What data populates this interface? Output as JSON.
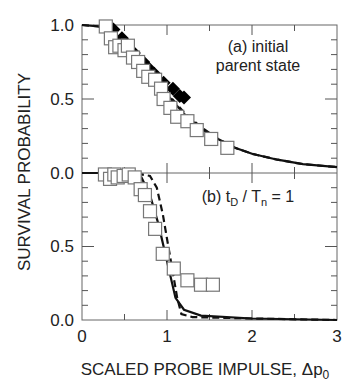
{
  "chart_data": [
    {
      "panel": "a",
      "type": "scatter",
      "annotation_line1": "(a) initial",
      "annotation_line2": "parent state",
      "xlabel": "SCALED  PROBE  IMPULSE, Δp0",
      "ylabel": "SURVIVAL  PROBABILITY",
      "xlim": [
        0,
        3
      ],
      "ylim": [
        0,
        1
      ],
      "yticks": [
        "0.0",
        "0.5",
        "1.0"
      ],
      "series": [
        {
          "name": "open squares (experiment)",
          "marker": "square-open",
          "points": [
            [
              0.28,
              0.99
            ],
            [
              0.34,
              0.91
            ],
            [
              0.39,
              0.85
            ],
            [
              0.44,
              0.86
            ],
            [
              0.5,
              0.83
            ],
            [
              0.54,
              0.86
            ],
            [
              0.6,
              0.78
            ],
            [
              0.66,
              0.75
            ],
            [
              0.72,
              0.69
            ],
            [
              0.78,
              0.65
            ],
            [
              0.86,
              0.63
            ],
            [
              0.93,
              0.57
            ],
            [
              0.96,
              0.5
            ],
            [
              1.04,
              0.44
            ],
            [
              1.12,
              0.38
            ],
            [
              1.24,
              0.35
            ],
            [
              1.35,
              0.29
            ],
            [
              1.52,
              0.23
            ],
            [
              1.71,
              0.17
            ]
          ]
        },
        {
          "name": "filled diamonds",
          "marker": "diamond-filled",
          "points": [
            [
              0.37,
              0.97
            ],
            [
              0.47,
              0.91
            ],
            [
              0.52,
              0.86
            ],
            [
              0.61,
              0.81
            ],
            [
              0.72,
              0.75
            ],
            [
              0.78,
              0.71
            ],
            [
              0.85,
              0.67
            ],
            [
              0.96,
              0.61
            ],
            [
              1.07,
              0.57
            ],
            [
              1.15,
              0.52
            ],
            [
              1.2,
              0.51
            ]
          ]
        },
        {
          "name": "solid line (theory)",
          "style": "solid",
          "points": [
            [
              0,
              1.0
            ],
            [
              0.2,
              0.99
            ],
            [
              0.4,
              0.93
            ],
            [
              0.6,
              0.82
            ],
            [
              0.8,
              0.68
            ],
            [
              1.0,
              0.53
            ],
            [
              1.2,
              0.4
            ],
            [
              1.4,
              0.3
            ],
            [
              1.6,
              0.23
            ],
            [
              1.8,
              0.17
            ],
            [
              2.0,
              0.13
            ],
            [
              2.3,
              0.09
            ],
            [
              2.6,
              0.06
            ],
            [
              3.0,
              0.04
            ]
          ]
        },
        {
          "name": "dashed line (theory)",
          "style": "dashed",
          "points": [
            [
              0,
              1.0
            ],
            [
              0.2,
              0.99
            ],
            [
              0.4,
              0.93
            ],
            [
              0.6,
              0.83
            ],
            [
              0.8,
              0.69
            ],
            [
              1.0,
              0.54
            ],
            [
              1.2,
              0.41
            ],
            [
              1.4,
              0.31
            ],
            [
              1.6,
              0.23
            ],
            [
              1.8,
              0.17
            ],
            [
              2.0,
              0.13
            ],
            [
              2.3,
              0.09
            ],
            [
              2.6,
              0.06
            ],
            [
              3.0,
              0.04
            ]
          ]
        }
      ]
    },
    {
      "panel": "b",
      "type": "scatter",
      "annotation": "(b) tD / Tn = 1",
      "xlim": [
        0,
        3
      ],
      "ylim": [
        0,
        1
      ],
      "xticks": [
        "0",
        "1",
        "2",
        "3"
      ],
      "yticks": [
        "0.0",
        "0.5"
      ],
      "series": [
        {
          "name": "open squares (experiment)",
          "marker": "square-open",
          "points": [
            [
              0.27,
              0.99
            ],
            [
              0.33,
              0.96
            ],
            [
              0.38,
              0.99
            ],
            [
              0.42,
              0.97
            ],
            [
              0.49,
              0.98
            ],
            [
              0.55,
              0.99
            ],
            [
              0.62,
              0.97
            ],
            [
              0.69,
              0.89
            ],
            [
              0.74,
              0.85
            ],
            [
              0.8,
              0.74
            ],
            [
              0.86,
              0.62
            ],
            [
              0.95,
              0.45
            ],
            [
              1.08,
              0.35
            ],
            [
              1.24,
              0.27
            ],
            [
              1.4,
              0.24
            ],
            [
              1.54,
              0.24
            ]
          ]
        },
        {
          "name": "solid line (theory)",
          "style": "solid",
          "points": [
            [
              0,
              1.0
            ],
            [
              0.5,
              1.0
            ],
            [
              0.7,
              0.97
            ],
            [
              0.8,
              0.85
            ],
            [
              0.9,
              0.65
            ],
            [
              1.0,
              0.4
            ],
            [
              1.1,
              0.15
            ],
            [
              1.2,
              0.07
            ],
            [
              1.4,
              0.03
            ],
            [
              2.0,
              0.01
            ],
            [
              3.0,
              0.0
            ]
          ]
        },
        {
          "name": "dashed line (theory)",
          "style": "dashed",
          "points": [
            [
              0,
              1.0
            ],
            [
              0.6,
              1.0
            ],
            [
              0.8,
              0.98
            ],
            [
              0.88,
              0.9
            ],
            [
              0.95,
              0.72
            ],
            [
              1.03,
              0.45
            ],
            [
              1.12,
              0.15
            ],
            [
              1.17,
              0.04
            ],
            [
              1.3,
              0.02
            ],
            [
              2.0,
              0.01
            ],
            [
              3.0,
              0.0
            ]
          ]
        }
      ]
    }
  ],
  "labels": {
    "ylabel": "SURVIVAL  PROBABILITY",
    "xlabel_main": "SCALED  PROBE  IMPULSE, Δp",
    "xlabel_sub": "0",
    "panel_a_line1": "(a) initial",
    "panel_a_line2": "parent state",
    "panel_b_pre": "(b) t",
    "panel_b_sub1": "D",
    "panel_b_mid": " / T",
    "panel_b_sub2": "n",
    "panel_b_post": " = 1",
    "ya_top": "1.0",
    "ya_mid": "0.5",
    "ya_bot": "0.0",
    "yb_mid": "0.5",
    "yb_bot": "0.0",
    "x0": "0",
    "x1": "1",
    "x2": "2",
    "x3": "3"
  }
}
